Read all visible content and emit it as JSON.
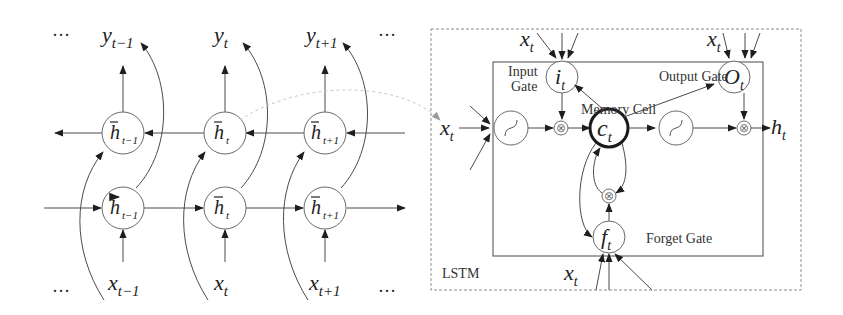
{
  "left_panel": {
    "title": "Bidirectional LSTM (unrolled)",
    "ellipsis": "…",
    "outputs": [
      {
        "base": "y",
        "sub": "t−1"
      },
      {
        "base": "y",
        "sub": "t"
      },
      {
        "base": "y",
        "sub": "t+1"
      }
    ],
    "inputs": [
      {
        "base": "x",
        "sub": "t−1"
      },
      {
        "base": "x",
        "sub": "t"
      },
      {
        "base": "x",
        "sub": "t+1"
      }
    ],
    "backward_states": [
      {
        "base": "h",
        "accent": "←",
        "sub": "t−1"
      },
      {
        "base": "h",
        "accent": "←",
        "sub": "t"
      },
      {
        "base": "h",
        "accent": "←",
        "sub": "t+1"
      }
    ],
    "forward_states": [
      {
        "base": "h",
        "accent": "→",
        "sub": "t−1"
      },
      {
        "base": "h",
        "accent": "→",
        "sub": "t"
      },
      {
        "base": "h",
        "accent": "→",
        "sub": "t+1"
      }
    ]
  },
  "right_panel": {
    "box_label": "LSTM",
    "input_label": {
      "base": "x",
      "sub": "t"
    },
    "output_label": {
      "base": "h",
      "sub": "t"
    },
    "input_gate": {
      "symbol": "i",
      "sub": "t",
      "label_line1": "Input",
      "label_line2": "Gate",
      "input": {
        "base": "x",
        "sub": "t"
      }
    },
    "output_gate": {
      "symbol": "O",
      "sub": "t",
      "label": "Output Gate",
      "input": {
        "base": "x",
        "sub": "t"
      }
    },
    "memory_cell": {
      "symbol": "c",
      "sub": "t",
      "label": "Memory Cell"
    },
    "forget_gate": {
      "symbol": "f",
      "sub": "t",
      "label": "Forget Gate",
      "input": {
        "base": "x",
        "sub": "t"
      }
    },
    "multiply_symbol": "⊗"
  },
  "colors": {
    "line": "#4a4a4a",
    "node_border": "#6a6a6a",
    "cell_border": "#1a1a1a",
    "dashed_box": "#8a8a8a",
    "connector": "#c8c8c8"
  }
}
